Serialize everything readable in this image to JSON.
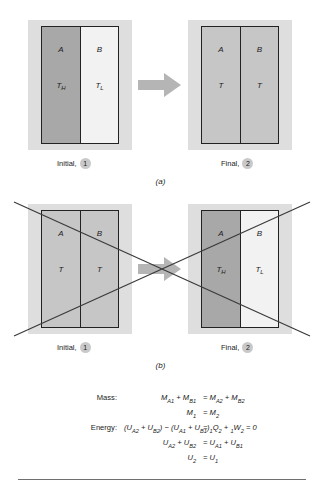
{
  "figure": {
    "panels": [
      {
        "id": "a",
        "letter": "(a)",
        "diagrams": [
          {
            "role": "initial",
            "caption_text": "Initial,",
            "state_number": "1",
            "chambers": [
              {
                "name": "A",
                "shade": "dark",
                "temp_label": "T",
                "temp_sub": "H"
              },
              {
                "name": "B",
                "shade": "light",
                "temp_label": "T",
                "temp_sub": "L"
              }
            ]
          },
          {
            "role": "final",
            "caption_text": "Final,",
            "state_number": "2",
            "chambers": [
              {
                "name": "A",
                "shade": "mid",
                "temp_label": "T",
                "temp_sub": ""
              },
              {
                "name": "B",
                "shade": "mid",
                "temp_label": "T",
                "temp_sub": ""
              }
            ]
          }
        ]
      },
      {
        "id": "b",
        "letter": "(b)",
        "crossed_out": true,
        "diagrams": [
          {
            "role": "initial",
            "caption_text": "Initial,",
            "state_number": "1",
            "chambers": [
              {
                "name": "A",
                "shade": "mid",
                "temp_label": "T",
                "temp_sub": ""
              },
              {
                "name": "B",
                "shade": "mid",
                "temp_label": "T",
                "temp_sub": ""
              }
            ]
          },
          {
            "role": "final",
            "caption_text": "Final,",
            "state_number": "2",
            "chambers": [
              {
                "name": "A",
                "shade": "dark",
                "temp_label": "T",
                "temp_sub": "H"
              },
              {
                "name": "B",
                "shade": "light",
                "temp_label": "T",
                "temp_sub": "L"
              }
            ]
          }
        ]
      }
    ]
  },
  "equations": {
    "rows": [
      {
        "tag": "Mass:",
        "lhs_html": "M<sub>A1</sub> + M<sub>B1</sub>",
        "rhs_html": "= M<sub>A2</sub> + M<sub>B2</sub>"
      },
      {
        "tag": "",
        "lhs_html": "M<sub>1</sub>",
        "rhs_html": "= M<sub>2</sub>"
      },
      {
        "tag": "Energy:",
        "lhs_html": "(U<sub>A2</sub> + U<sub>B2</sub>) − (U<sub>A1</sub> + U<sub>B1</sub>)",
        "rhs_html": "= <span class=\"presub\">1</span>Q<sub>2</sub> + <span class=\"presub\">1</span>W<sub>2</sub> = 0"
      },
      {
        "tag": "",
        "lhs_html": "U<sub>A2</sub> + U<sub>B2</sub>",
        "rhs_html": "= U<sub>A1</sub> + U<sub>B1</sub>"
      },
      {
        "tag": "",
        "lhs_html": "U<sub>2</sub>",
        "rhs_html": "= U<sub>1</sub>"
      }
    ]
  },
  "colors": {
    "plate": "#dedede",
    "chamber_dark": "#a8a8a8",
    "chamber_mid": "#c6c6c6",
    "chamber_light": "#f2f2f2",
    "outline": "#222222",
    "arrow": "#b5b5b5",
    "bubble": "#c9c9c9",
    "rule": "#6f6f6f"
  }
}
